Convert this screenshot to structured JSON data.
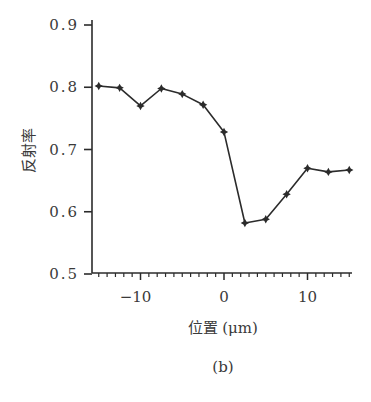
{
  "chart_data": {
    "type": "line",
    "title": "",
    "caption": "(b)",
    "xlabel": "位置 (μm)",
    "xlabel_main": "位置",
    "xlabel_unit": "(μm)",
    "ylabel": "反射率",
    "xlim": [
      -16,
      15.5
    ],
    "ylim": [
      0.5,
      0.9
    ],
    "grid": false,
    "legend": null,
    "x_ticks_major": [
      -10,
      0,
      10
    ],
    "x_tick_labels": [
      "−10",
      "0",
      "10"
    ],
    "x_minor_step": 1,
    "y_ticks": [
      0.5,
      0.6,
      0.7,
      0.8,
      0.9
    ],
    "y_tick_labels": [
      "0.5",
      "0.6",
      "0.7",
      "0.8",
      "0.9"
    ],
    "series": [
      {
        "name": "反射率",
        "marker": "diamond-star",
        "color": "#2b2b2b",
        "x": [
          -15,
          -12.5,
          -10,
          -7.5,
          -5,
          -2.5,
          0,
          2.5,
          5,
          7.5,
          10,
          12.5,
          15
        ],
        "values": [
          0.802,
          0.799,
          0.77,
          0.798,
          0.789,
          0.772,
          0.728,
          0.582,
          0.588,
          0.628,
          0.67,
          0.664,
          0.667
        ]
      }
    ]
  },
  "colors": {
    "axis": "#2b2b2b",
    "line": "#2b2b2b",
    "text": "#3a3a3a",
    "background": "#ffffff"
  }
}
